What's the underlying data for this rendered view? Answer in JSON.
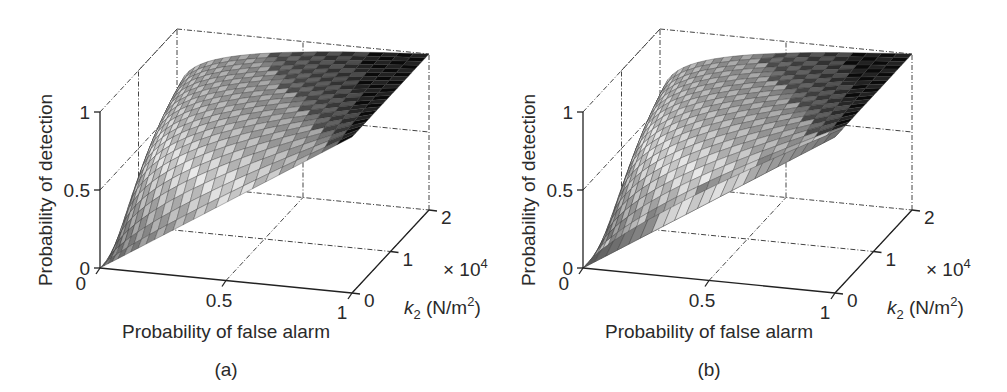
{
  "figure": {
    "panels": [
      {
        "label": "(a)",
        "xlabel": "Probability of false alarm",
        "ylabel": "Probability of detection",
        "zlabel_k": "k",
        "zlabel_sub": "2",
        "zlabel_unit": " (N/m",
        "zlabel_unit_sup": "2",
        "zlabel_close": ")",
        "scale_prefix": "× 10",
        "scale_exp": "4",
        "x_ticks": [
          "0",
          "0.5",
          "1"
        ],
        "y_ticks": [
          "0",
          "0.5",
          "1"
        ],
        "k_ticks": [
          "0",
          "1",
          "2"
        ]
      },
      {
        "label": "(b)",
        "xlabel": "Probability of false alarm",
        "ylabel": "Probability of detection",
        "zlabel_k": "k",
        "zlabel_sub": "2",
        "zlabel_unit": " (N/m",
        "zlabel_unit_sup": "2",
        "zlabel_close": ")",
        "scale_prefix": "× 10",
        "scale_exp": "4",
        "x_ticks": [
          "0",
          "0.5",
          "1"
        ],
        "y_ticks": [
          "0",
          "0.5",
          "1"
        ],
        "k_ticks": [
          "0",
          "1",
          "2"
        ]
      }
    ]
  },
  "chart_data": [
    {
      "type": "surface3d",
      "title": "(a)",
      "xlabel": "Probability of false alarm",
      "ylabel": "k2 (N/m^2) × 10^4",
      "zlabel": "Probability of detection",
      "xlim": [
        0,
        1
      ],
      "ylim": [
        0,
        2
      ],
      "zlim": [
        0,
        1
      ],
      "x_ticks": [
        0,
        0.5,
        1
      ],
      "y_ticks": [
        0,
        1,
        2
      ],
      "z_ticks": [
        0,
        0.5,
        1
      ],
      "grid": true,
      "colormap": "grayscale (dark = high Pd)",
      "description": "ROC surface: Pd vs Pfa for increasing k2; curves rise steeply toward Pd=1 as k2 increases",
      "series": [
        {
          "name": "k2=0",
          "x": [
            0,
            0.25,
            0.5,
            0.75,
            1
          ],
          "values": [
            0,
            0.25,
            0.5,
            0.75,
            1
          ]
        },
        {
          "name": "k2=1e4",
          "x": [
            0,
            0.05,
            0.1,
            0.25,
            0.5,
            0.75,
            1
          ],
          "values": [
            0,
            0.45,
            0.65,
            0.85,
            0.95,
            0.99,
            1
          ]
        },
        {
          "name": "k2=2e4",
          "x": [
            0,
            0.02,
            0.05,
            0.1,
            0.25,
            0.5,
            1
          ],
          "values": [
            0,
            0.6,
            0.85,
            0.95,
            0.99,
            1,
            1
          ]
        }
      ]
    },
    {
      "type": "surface3d",
      "title": "(b)",
      "xlabel": "Probability of false alarm",
      "ylabel": "k2 (N/m^2) × 10^4",
      "zlabel": "Probability of detection",
      "xlim": [
        0,
        1
      ],
      "ylim": [
        0,
        2
      ],
      "zlim": [
        0,
        1
      ],
      "x_ticks": [
        0,
        0.5,
        1
      ],
      "y_ticks": [
        0,
        1,
        2
      ],
      "z_ticks": [
        0,
        0.5,
        1
      ],
      "grid": true,
      "colormap": "grayscale (dark = high Pd)",
      "description": "ROC surface: Pd vs Pfa for increasing k2; front edge (k2=0) is a straight chance line with vertical facets, surface rises toward Pd=1 as k2 increases",
      "series": [
        {
          "name": "k2=0",
          "x": [
            0,
            0.25,
            0.5,
            0.75,
            1
          ],
          "values": [
            0,
            0.25,
            0.5,
            0.75,
            1
          ]
        },
        {
          "name": "k2=1e4",
          "x": [
            0,
            0.05,
            0.1,
            0.25,
            0.5,
            0.75,
            1
          ],
          "values": [
            0,
            0.35,
            0.55,
            0.8,
            0.93,
            0.98,
            1
          ]
        },
        {
          "name": "k2=2e4",
          "x": [
            0,
            0.02,
            0.05,
            0.1,
            0.25,
            0.5,
            1
          ],
          "values": [
            0,
            0.55,
            0.8,
            0.93,
            0.99,
            1,
            1
          ]
        }
      ]
    }
  ]
}
